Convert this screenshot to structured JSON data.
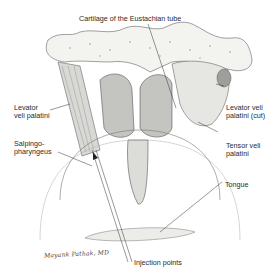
{
  "figure": {
    "labels": [
      {
        "id": "cartilage",
        "text": "Cartilage of the Eustachian tube"
      },
      {
        "id": "levator-left",
        "text": "Levator\nveli palatini"
      },
      {
        "id": "levator-cut",
        "text": "Levator veli\npalatini (cut)"
      },
      {
        "id": "salpingo",
        "text": "Salpingo-\npharyngeus"
      },
      {
        "id": "tensor",
        "text": "Tensor veli\npalatini"
      },
      {
        "id": "tongue",
        "text": "Tongue"
      },
      {
        "id": "injection",
        "text": "Injection points"
      }
    ],
    "signature": "Mayank Pathak, MD"
  }
}
